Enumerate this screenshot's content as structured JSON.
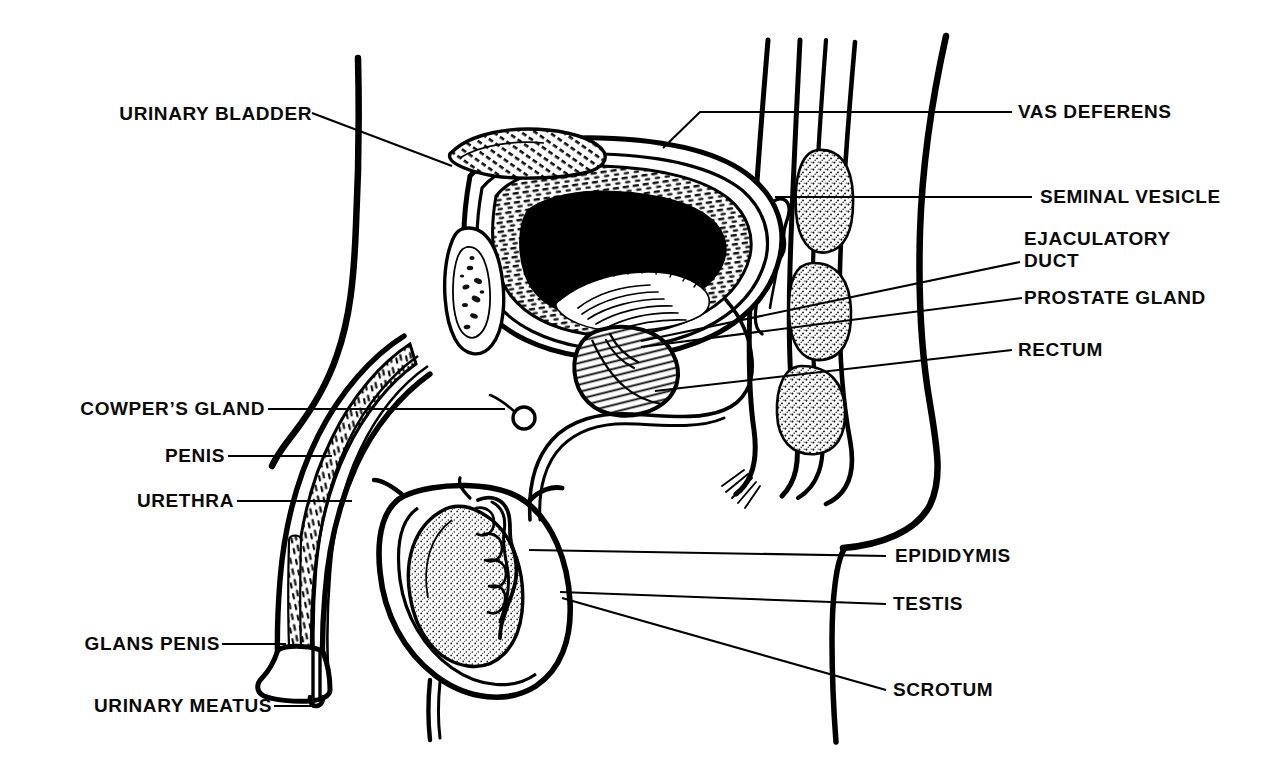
{
  "figure": {
    "kind": "anatomical-line-diagram",
    "background_color": "#ffffff",
    "ink_color": "#000000"
  },
  "labels": {
    "urinary_bladder": "URINARY BLADDER",
    "cowpers_gland": "COWPER’S GLAND",
    "penis": "PENIS",
    "urethra": "URETHRA",
    "glans_penis": "GLANS PENIS",
    "urinary_meatus": "URINARY MEATUS",
    "vas_deferens": "VAS DEFERENS",
    "seminal_vesicle": "SEMINAL VESICLE",
    "ejaculatory_duct_line1": "EJACULATORY",
    "ejaculatory_duct_line2": "DUCT",
    "prostate_gland": "PROSTATE GLAND",
    "rectum": "RECTUM",
    "epididymis": "EPIDIDYMIS",
    "testis": "TESTIS",
    "scrotum": "SCROTUM"
  },
  "structures": [
    {
      "name": "urinary-bladder",
      "description": "cross-sectioned bladder with hatched muscular wall and dark lumen"
    },
    {
      "name": "pubic-bone",
      "description": "stippled oval anterior to bladder"
    },
    {
      "name": "prostate-gland",
      "description": "hatched rounded gland below bladder neck"
    },
    {
      "name": "seminal-vesicle",
      "description": "lobulated sac posterior to bladder"
    },
    {
      "name": "rectum",
      "description": "tube with three stippled fecal masses"
    },
    {
      "name": "penis-shaft",
      "description": "curving shaft with hatched corpus cavernosum and urethral channel"
    },
    {
      "name": "glans-penis",
      "description": "bulbous distal tip of penis"
    },
    {
      "name": "urinary-meatus",
      "description": "opening at tip of glans"
    },
    {
      "name": "cowpers-gland",
      "description": "small circular gland below prostate"
    },
    {
      "name": "testis",
      "description": "stippled ovoid within scrotum"
    },
    {
      "name": "epididymis",
      "description": "coiled structure over posterior testis"
    },
    {
      "name": "scrotum",
      "description": "outer sac enclosing testis"
    },
    {
      "name": "vas-deferens",
      "description": "duct ascending from epididymis over bladder"
    },
    {
      "name": "body-outline-anterior",
      "description": "abdominal wall contour on left"
    },
    {
      "name": "body-outline-posterior",
      "description": "buttock contour on right"
    }
  ]
}
